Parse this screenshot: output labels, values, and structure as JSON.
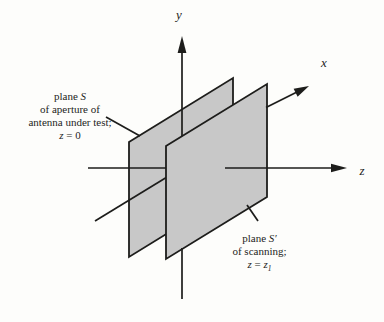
{
  "figure": {
    "background_color": "#fdfdfb",
    "plane_fill_color": "#c8c8c8",
    "line_color": "#1d1d1b"
  },
  "axes": {
    "x_label": "x",
    "y_label": "y",
    "z_label": "z"
  },
  "labels": {
    "aperture_plane": {
      "line1_prefix": "plane ",
      "line1_var": "S",
      "line2": "of aperture of",
      "line3": "antenna under test;",
      "line4_var": "z",
      "line4_rest": " = 0"
    },
    "scan_plane": {
      "line1_prefix": "plane ",
      "line1_var": "S′",
      "line2": "of scanning;",
      "line3_var1": "z",
      "line3_eq": " = ",
      "line3_var2": "z",
      "line3_sub": "1"
    }
  }
}
